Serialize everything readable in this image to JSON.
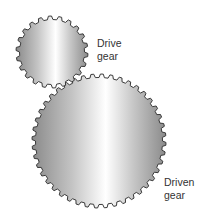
{
  "diagram": {
    "drive_gear": {
      "label_line1": "Drive",
      "label_line2": "gear",
      "cx": 52,
      "cy": 52,
      "r_outer": 36,
      "r_inner": 32.5,
      "teeth": 22
    },
    "driven_gear": {
      "label_line1": "Driven",
      "label_line2": "gear",
      "cx": 99,
      "cy": 141,
      "r_outer": 67,
      "r_inner": 63.5,
      "teeth": 44
    },
    "colors": {
      "outline": "#3a3a3a",
      "shade_dark": "#8c8c8c",
      "shade_mid": "#b8b8b8",
      "highlight": "#ffffff"
    }
  }
}
